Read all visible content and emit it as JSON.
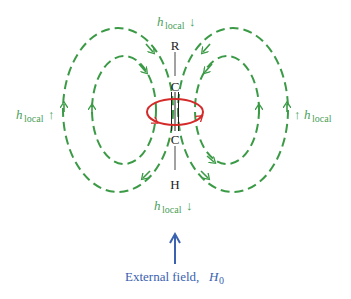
{
  "diagram": {
    "molecule": {
      "top_label": "R",
      "upper_carbon": "C",
      "lower_carbon": "C",
      "bottom_label": "H",
      "bond": "triple bond (C≡C)"
    },
    "labels": {
      "h_local_top": {
        "main": "h",
        "sub": "local",
        "arrow": "↓"
      },
      "h_local_bottom": {
        "main": "h",
        "sub": "local",
        "arrow": "↓"
      },
      "h_local_left": {
        "main": "h",
        "sub": "local",
        "arrow": "↑"
      },
      "h_local_right": {
        "main": "h",
        "sub": "local",
        "arrow": "↑"
      },
      "external_field": {
        "text": "External field, ",
        "symbol": "H",
        "sub": "0"
      }
    },
    "colors": {
      "field_lines": "#3a9a45",
      "label_green": "#4aa05a",
      "current_loop": "#d42a2a",
      "external_field": "#3a62b0",
      "molecule": "#222222"
    },
    "elements": {
      "induced_field_lines": "dashed green loops (2 per side)",
      "circulating_electrons": "red ellipse with arrows",
      "external_field_arrow": "blue upward arrow"
    }
  }
}
